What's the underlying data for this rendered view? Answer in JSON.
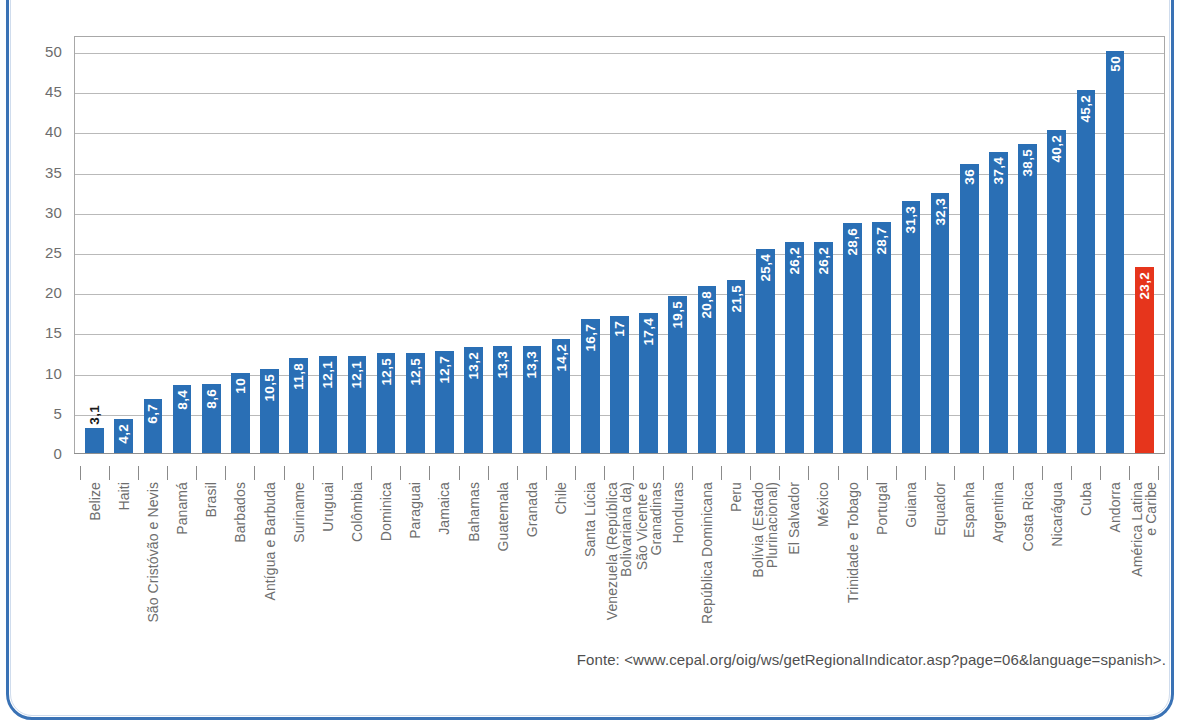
{
  "source_note": "Fonte: <www.cepal.org/oig/ws/getRegionalIndicator.asp?page=06&language=spanish>.",
  "colors": {
    "bar_blue": "#2a6fb5",
    "bar_red": "#e6351c",
    "frame_blue": "#3a72b5",
    "grid": "#b9b9b9",
    "axis_text": "#6d6d6d"
  },
  "chart_data": {
    "type": "bar",
    "title": "",
    "subtitle": "",
    "xlabel": "",
    "ylabel": "",
    "ylim": [
      0,
      52
    ],
    "yticks": [
      0,
      5,
      10,
      15,
      20,
      25,
      30,
      35,
      40,
      45,
      50
    ],
    "ytick_labels": [
      "0",
      "5",
      "10",
      "15",
      "20",
      "25",
      "30",
      "35",
      "40",
      "45",
      "50"
    ],
    "grid": true,
    "legend": "none",
    "decimal_separator": ",",
    "categories": [
      "Belize",
      "Haiti",
      "São Cristóvão e Nevis",
      "Panamá",
      "Brasil",
      "Barbados",
      "Antígua e Barbuda",
      "Suriname",
      "Uruguai",
      "Colômbia",
      "Dominica",
      "Paraguai",
      "Jamaica",
      "Bahamas",
      "Guatemala",
      "Granada",
      "Chile",
      "Santa Lúcia",
      "Venezuela (República\nBolivariana da)",
      "São Vicente e\nGranadinas",
      "Honduras",
      "República Dominicana",
      "Peru",
      "Bolívia (Estado\nPlurinacional)",
      "El Salvador",
      "México",
      "Trinidade e Tobago",
      "Portugal",
      "Guiana",
      "Equador",
      "Espanha",
      "Argentina",
      "Costa Rica",
      "Nicarágua",
      "Cuba",
      "Andorra",
      "América Latina\ne Caribe"
    ],
    "values": [
      3.1,
      4.2,
      6.7,
      8.4,
      8.6,
      10,
      10.5,
      11.8,
      12.1,
      12.1,
      12.5,
      12.5,
      12.7,
      13.2,
      13.3,
      13.3,
      14.2,
      16.7,
      17,
      17.4,
      19.5,
      20.8,
      21.5,
      25.4,
      26.2,
      26.2,
      28.6,
      28.7,
      31.3,
      32.3,
      36,
      37.4,
      38.5,
      40.2,
      45.2,
      50,
      23.2
    ],
    "value_labels": [
      "3,1",
      "4,2",
      "6,7",
      "8,4",
      "8,6",
      "10",
      "10,5",
      "11,8",
      "12,1",
      "12,1",
      "12,5",
      "12,5",
      "12,7",
      "13,2",
      "13,3",
      "13,3",
      "14,2",
      "16,7",
      "17",
      "17,4",
      "19,5",
      "20,8",
      "21,5",
      "25,4",
      "26,2",
      "26,2",
      "28,6",
      "28,7",
      "31,3",
      "32,3",
      "36",
      "37,4",
      "38,5",
      "40,2",
      "45,2",
      "50",
      "23,2"
    ],
    "highlight_index": 36,
    "highlight_color": "#e6351c",
    "label_outside_indices": [
      0
    ]
  }
}
